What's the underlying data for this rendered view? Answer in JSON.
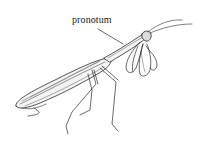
{
  "figure": {
    "labels": [
      {
        "text": "pronotum",
        "target": "pronotum"
      }
    ],
    "colors": {
      "ink": "#222222",
      "background": "#ffffff"
    }
  }
}
